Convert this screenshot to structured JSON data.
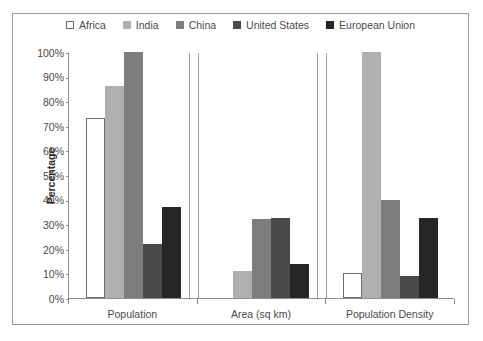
{
  "chart_data": {
    "type": "bar",
    "title": "",
    "xlabel": "",
    "ylabel": "Percentage",
    "ylim": [
      0,
      100
    ],
    "ytick_labels": [
      "100%",
      "90%",
      "80%",
      "70%",
      "60%",
      "50%",
      "40%",
      "30%",
      "20%",
      "10%",
      "0%"
    ],
    "ytick_values": [
      100,
      90,
      80,
      70,
      60,
      50,
      40,
      30,
      20,
      10,
      0
    ],
    "grid": false,
    "legend_position": "top",
    "categories": [
      "Population",
      "Area (sq km)",
      "Population Density"
    ],
    "series": [
      {
        "name": "Africa",
        "color": "#ffffff",
        "border": "#6b6b6b",
        "values": [
          73,
          0,
          10
        ]
      },
      {
        "name": "India",
        "color": "#b0b0b0",
        "border": "#b0b0b0",
        "values": [
          86,
          11,
          100
        ]
      },
      {
        "name": "China",
        "color": "#7d7d7d",
        "border": "#7d7d7d",
        "values": [
          100,
          32,
          40
        ]
      },
      {
        "name": "United States",
        "color": "#4a4a4a",
        "border": "#4a4a4a",
        "values": [
          22,
          32.5,
          9
        ]
      },
      {
        "name": "European Union",
        "color": "#262626",
        "border": "#262626",
        "values": [
          37,
          14,
          32.5
        ]
      }
    ]
  }
}
